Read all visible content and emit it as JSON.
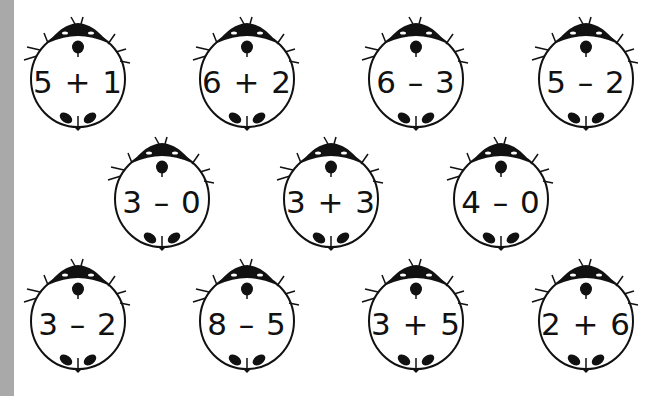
{
  "worksheet": {
    "strip_color": "#a9a9a9",
    "ink_color": "#111111",
    "ladybugs": [
      {
        "expression": "5 + 1",
        "row": 1,
        "x": 22,
        "y": 16
      },
      {
        "expression": "6 + 2",
        "row": 1,
        "x": 191,
        "y": 16
      },
      {
        "expression": "6 – 3",
        "row": 1,
        "x": 360,
        "y": 16
      },
      {
        "expression": "5 – 2",
        "row": 1,
        "x": 530,
        "y": 16
      },
      {
        "expression": "3 – 0",
        "row": 2,
        "x": 106,
        "y": 136
      },
      {
        "expression": "3 + 3",
        "row": 2,
        "x": 275,
        "y": 136
      },
      {
        "expression": "4 – 0",
        "row": 2,
        "x": 445,
        "y": 136
      },
      {
        "expression": "3 – 2",
        "row": 3,
        "x": 22,
        "y": 258
      },
      {
        "expression": "8 – 5",
        "row": 3,
        "x": 191,
        "y": 258
      },
      {
        "expression": "3 + 5",
        "row": 3,
        "x": 360,
        "y": 258
      },
      {
        "expression": "2 + 6",
        "row": 3,
        "x": 530,
        "y": 258
      }
    ]
  }
}
